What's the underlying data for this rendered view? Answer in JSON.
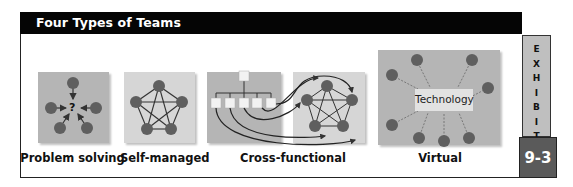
{
  "header": {
    "title": "Four Types of Teams"
  },
  "exhibit": {
    "letters": [
      "E",
      "X",
      "H",
      "I",
      "B",
      "I",
      "T"
    ],
    "number": "9-3"
  },
  "panels": [
    {
      "id": "problem-solving",
      "label": "Problem solving",
      "center_symbol": "?"
    },
    {
      "id": "self-managed",
      "label": "Self-managed"
    },
    {
      "id": "cross-functional",
      "label": "Cross-functional"
    },
    {
      "id": "virtual",
      "label": "Virtual",
      "center_text": "Technology"
    }
  ],
  "colors": {
    "header_bg": "#050505",
    "panel_dark": "#b5b5b5",
    "panel_light": "#d6d6d6",
    "node": "#5f5f5f",
    "exhibit_tab": "#bfbfbf",
    "exhibit_num_bg": "#5a5a5a"
  }
}
